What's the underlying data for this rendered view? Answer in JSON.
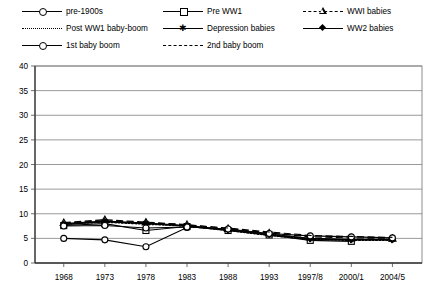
{
  "chart_data": {
    "type": "line",
    "title": "",
    "subtitle": "",
    "xlabel": "",
    "ylabel": "",
    "x": [
      "1968",
      "1973",
      "1978",
      "1983",
      "1988",
      "1993",
      "1997/8",
      "2000/1",
      "2004/5"
    ],
    "categories": [
      "1968",
      "1973",
      "1978",
      "1983",
      "1988",
      "1993",
      "1997/8",
      "2000/1",
      "2004/5"
    ],
    "ylim": [
      0,
      40
    ],
    "yticks": [
      0,
      5,
      10,
      15,
      20,
      25,
      30,
      35,
      40
    ],
    "ytick_labels": [
      "0",
      "5",
      "10",
      "15",
      "20",
      "25",
      "30",
      "35",
      "40"
    ],
    "grid": "horizontal",
    "legend_position": "top",
    "series": [
      {
        "name": "pre-1900s",
        "marker": "circle-open",
        "line": "solid",
        "values": [
          5.0,
          4.7,
          3.3,
          7.2,
          null,
          null,
          null,
          null,
          null
        ]
      },
      {
        "name": "Pre WW1",
        "marker": "square-open",
        "line": "solid",
        "values": [
          7.6,
          8.0,
          6.6,
          7.4,
          6.6,
          5.7,
          4.6,
          4.4,
          null
        ]
      },
      {
        "name": "WWI babies",
        "marker": "triangle-open",
        "line": "dashed",
        "values": [
          8.2,
          8.8,
          8.3,
          7.8,
          7.0,
          6.1,
          5.3,
          5.1,
          5.0
        ]
      },
      {
        "name": "Post WW1 baby-boom",
        "marker": "none",
        "line": "dotted",
        "values": [
          7.9,
          8.3,
          7.9,
          7.5,
          6.6,
          5.6,
          4.8,
          4.6,
          4.6
        ]
      },
      {
        "name": "Depression babies",
        "marker": "star",
        "line": "solid",
        "values": [
          8.0,
          8.5,
          8.1,
          7.6,
          6.8,
          5.9,
          5.0,
          4.8,
          4.8
        ]
      },
      {
        "name": "WW2 babies",
        "marker": "diamond-filled",
        "line": "solid",
        "values": [
          7.8,
          8.4,
          8.0,
          7.5,
          6.7,
          5.8,
          4.9,
          4.7,
          4.7
        ]
      },
      {
        "name": "1st baby boom",
        "marker": "circle-open",
        "line": "solid",
        "values": [
          7.5,
          7.6,
          7.1,
          7.3,
          6.9,
          6.0,
          5.5,
          5.3,
          5.1
        ]
      },
      {
        "name": "2nd baby boom",
        "marker": "none",
        "line": "dashed",
        "values": [
          8.1,
          8.6,
          8.2,
          7.7,
          7.1,
          6.3,
          5.6,
          5.4,
          5.2
        ]
      }
    ]
  },
  "legend": {
    "rows": [
      [
        {
          "label": "pre-1900s",
          "key": "solid-circle-open"
        },
        {
          "label": "Pre WW1",
          "key": "solid-square-open"
        },
        {
          "label": "WWI babies",
          "key": "dashed-triangle-open"
        }
      ],
      [
        {
          "label": "Post WW1 baby-boom",
          "key": "dotted-none"
        },
        {
          "label": "Depression babies",
          "key": "solid-star"
        },
        {
          "label": "WW2 babies",
          "key": "solid-diamond"
        }
      ],
      [
        {
          "label": "1st baby boom",
          "key": "solid-circle-open"
        },
        {
          "label": "2nd baby boom",
          "key": "dashed-none"
        }
      ]
    ]
  },
  "colors": {
    "line": "#000000",
    "grid": "#808080",
    "axis": "#606060",
    "background": "#ffffff"
  }
}
